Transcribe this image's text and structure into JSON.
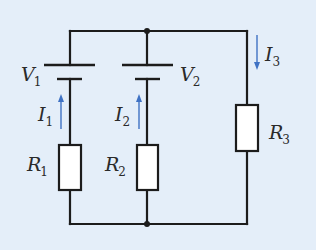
{
  "diagram": {
    "type": "circuit",
    "colors": {
      "background": "#e4eef9",
      "wire": "#1c1c1c",
      "arrow": "#3f72c4",
      "resistor_fill": "#ffffff"
    },
    "sources": [
      {
        "id": "V1",
        "symbol": "V",
        "subscript": "1"
      },
      {
        "id": "V2",
        "symbol": "V",
        "subscript": "2"
      }
    ],
    "resistors": [
      {
        "id": "R1",
        "symbol": "R",
        "subscript": "1"
      },
      {
        "id": "R2",
        "symbol": "R",
        "subscript": "2"
      },
      {
        "id": "R3",
        "symbol": "R",
        "subscript": "3"
      }
    ],
    "currents": [
      {
        "id": "I1",
        "symbol": "I",
        "subscript": "1",
        "direction": "up"
      },
      {
        "id": "I2",
        "symbol": "I",
        "subscript": "2",
        "direction": "up"
      },
      {
        "id": "I3",
        "symbol": "I",
        "subscript": "3",
        "direction": "down"
      }
    ],
    "branches": [
      {
        "name": "left",
        "elements": [
          "V1",
          "R1"
        ],
        "current": "I1"
      },
      {
        "name": "middle",
        "elements": [
          "V2",
          "R2"
        ],
        "current": "I2"
      },
      {
        "name": "right",
        "elements": [
          "R3"
        ],
        "current": "I3"
      }
    ],
    "junctions": 2
  }
}
